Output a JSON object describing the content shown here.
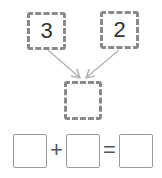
{
  "diagram": {
    "top_boxes": [
      {
        "value": "3"
      },
      {
        "value": "2"
      }
    ],
    "middle_box": {
      "value": ""
    },
    "equation": {
      "boxes": [
        "",
        "",
        ""
      ],
      "plus": "+",
      "equals": "="
    },
    "colors": {
      "box_border": "#8a8a8a",
      "arrow": "#b0b0b0",
      "equation_box_border": "#9a9a9a"
    }
  }
}
